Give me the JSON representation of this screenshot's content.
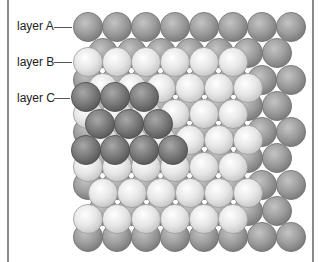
{
  "figure": {
    "labels": [
      {
        "id": "A",
        "text": "layer A",
        "y": 27
      },
      {
        "id": "B",
        "text": "layer B",
        "y": 62
      },
      {
        "id": "C",
        "text": "layer C",
        "y": 97
      }
    ],
    "colors": {
      "layer_A": {
        "base": "#9c9c9c",
        "highlight": "#c4c4c4",
        "edge": "#6e6e6e"
      },
      "layer_B": {
        "base": "#e2e2e2",
        "highlight": "#ffffff",
        "edge": "#9a9a9a"
      },
      "layer_C": {
        "base": "#7a7a7a",
        "highlight": "#a8a8a8",
        "edge": "#4a4a4a"
      },
      "frame": "#8a8a8a"
    },
    "sphere_radius": 14.6,
    "layers": {
      "A": {
        "row_y": [
          27,
          53,
          80,
          106,
          132,
          158,
          185,
          211,
          237
        ],
        "even_x_start": 88,
        "even_count": 8,
        "odd_x_start": 103,
        "odd_count": 7,
        "dx": 29
      },
      "B": {
        "row_y": [
          62,
          88,
          114,
          140,
          167,
          193,
          219
        ],
        "even_x_start": 88,
        "even_count": 6,
        "odd_x_start": 103,
        "odd_count": 6,
        "dx": 29
      },
      "C": {
        "rows": [
          {
            "y": 97,
            "x_start": 86,
            "count": 3
          },
          {
            "y": 124,
            "x_start": 100,
            "count": 3
          },
          {
            "y": 150,
            "x_start": 86,
            "count": 4
          }
        ],
        "dx": 29
      }
    }
  }
}
